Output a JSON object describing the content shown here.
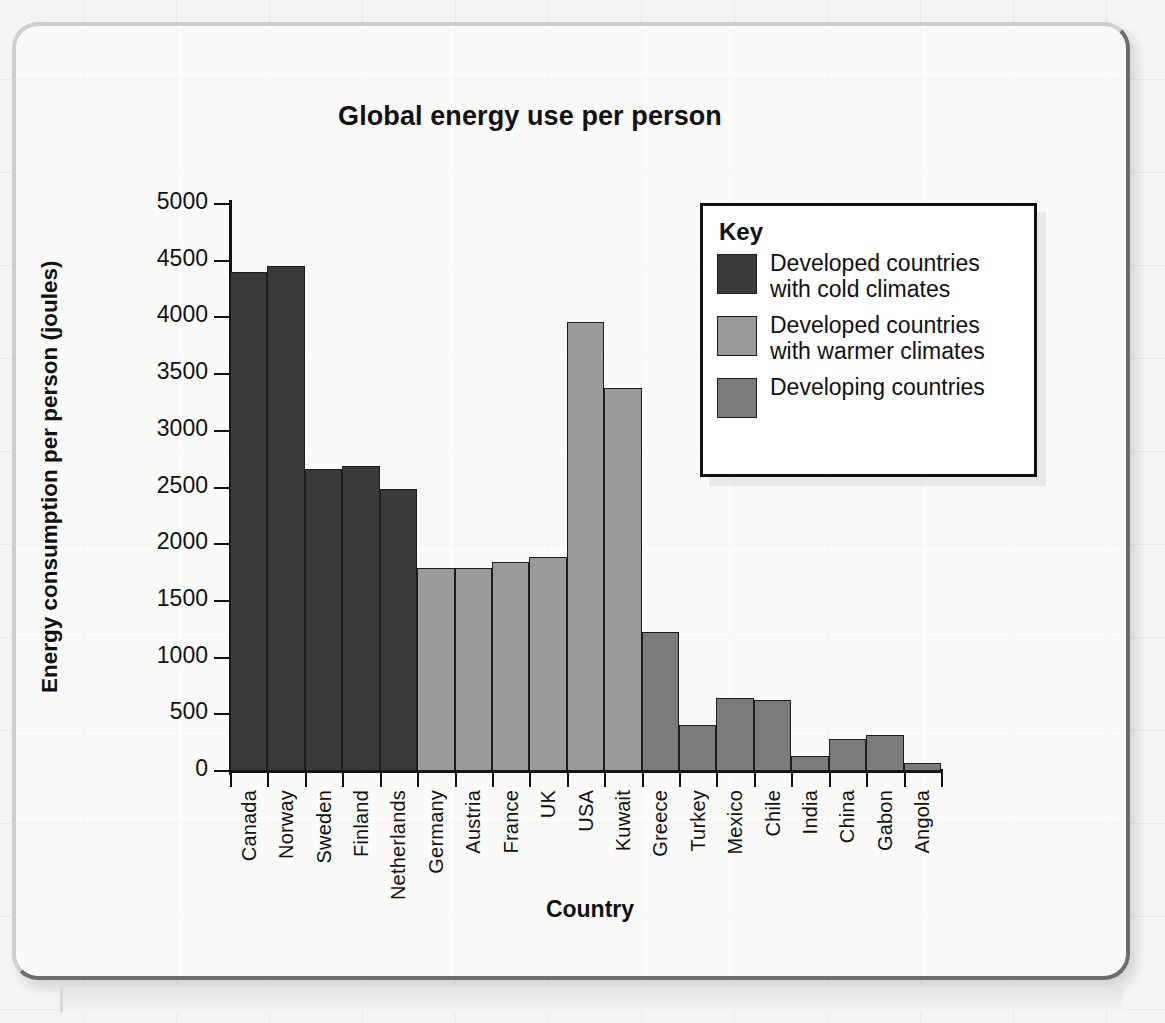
{
  "chart_data": {
    "type": "bar",
    "title": "Global energy use per person",
    "xlabel": "Country",
    "ylabel": "Energy consumption per person (joules)",
    "ylim": [
      0,
      5000
    ],
    "ytick_step": 500,
    "ytick_labels": [
      "5000",
      "4500",
      "4000",
      "3500",
      "3000",
      "2500",
      "2000",
      "1500",
      "1000",
      "500",
      "0"
    ],
    "grid": false,
    "legend_position": "upper-right-inside",
    "categories": [
      "Canada",
      "Norway",
      "Sweden",
      "Finland",
      "Netherlands",
      "Germany",
      "Austria",
      "France",
      "UK",
      "USA",
      "Kuwait",
      "Greece",
      "Turkey",
      "Mexico",
      "Chile",
      "India",
      "China",
      "Gabon",
      "Angola"
    ],
    "values": [
      4400,
      4450,
      2660,
      2690,
      2490,
      1790,
      1790,
      1845,
      1890,
      3960,
      3380,
      1230,
      410,
      640,
      630,
      130,
      280,
      320,
      70
    ],
    "group_of_bar": [
      "cold",
      "cold",
      "cold",
      "cold",
      "cold",
      "warm",
      "warm",
      "warm",
      "warm",
      "warm",
      "warm",
      "developing",
      "developing",
      "developing",
      "developing",
      "developing",
      "developing",
      "developing",
      "developing"
    ],
    "groups": [
      {
        "key": "cold",
        "label": "Developed countries with cold climates",
        "color": "#3a3a3a"
      },
      {
        "key": "warm",
        "label": "Developed countries with warmer climates",
        "color": "#9a9a9a"
      },
      {
        "key": "developing",
        "label": "Developing countries",
        "color": "#7b7b7b"
      }
    ]
  },
  "legend": {
    "title": "Key",
    "entries": [
      {
        "label_line1": "Developed countries",
        "label_line2": "with cold climates",
        "color": "#3a3a3a"
      },
      {
        "label_line1": "Developed countries",
        "label_line2": "with warmer climates",
        "color": "#9a9a9a"
      },
      {
        "label_line1": "Developing countries",
        "label_line2": "",
        "color": "#7b7b7b"
      }
    ]
  }
}
